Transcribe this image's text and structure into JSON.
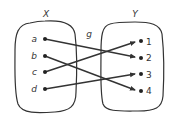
{
  "diagram": {
    "type": "function-mapping",
    "function_label": "g",
    "domain": {
      "label": "X",
      "elements": [
        "a",
        "b",
        "c",
        "d"
      ]
    },
    "codomain": {
      "label": "Y",
      "elements": [
        "1",
        "2",
        "3",
        "4"
      ]
    },
    "mapping": [
      {
        "from": "a",
        "to": "2"
      },
      {
        "from": "b",
        "to": "4"
      },
      {
        "from": "c",
        "to": "1"
      },
      {
        "from": "d",
        "to": "3"
      }
    ],
    "colors": {
      "stroke": "#333333",
      "background": "#ffffff"
    }
  }
}
